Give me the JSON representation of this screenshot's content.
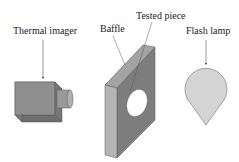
{
  "labels": {
    "thermal_imager": "Thermal imager",
    "baffle": "Baffle",
    "tested_piece": "Tested piece",
    "flash_lamp": "Flash lamp"
  },
  "colors": {
    "background": "#ffffff",
    "text": "#222222",
    "camera_front": "#8f8f8f",
    "camera_top": "#a8a8a8",
    "camera_side": "#6e6e6e",
    "lens": "#9a9a9a",
    "baffle_face": "#7d7d7d",
    "baffle_edge": "#b5b5b5",
    "baffle_top": "#a3a3a3",
    "lamp_fill": "#d4d4d4",
    "lamp_stroke": "#808080",
    "arrow": "#555555"
  }
}
